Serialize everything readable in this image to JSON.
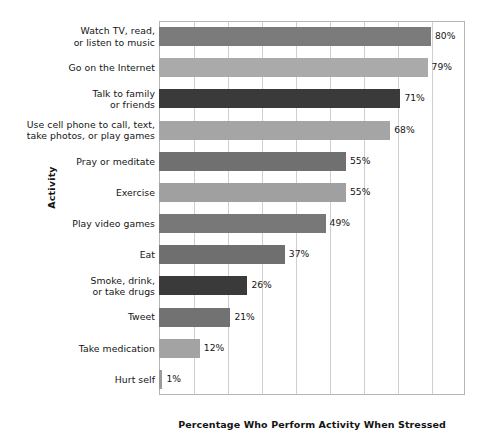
{
  "chart_data": {
    "type": "bar",
    "orientation": "horizontal",
    "title": "",
    "xlabel": "Percentage Who Perform Activity When Stressed",
    "ylabel": "Activity",
    "xlim": [
      0,
      90
    ],
    "xtick_interval": 10,
    "grid": true,
    "legend": null,
    "value_suffix": "%",
    "categories": [
      "Watch TV, read, or listen to music",
      "Go on the Internet",
      "Talk to family or friends",
      "Use cell phone to call, text, take photos, or play games",
      "Pray or meditate",
      "Exercise",
      "Play video games",
      "Eat",
      "Smoke, drink, or take drugs",
      "Tweet",
      "Take medication",
      "Hurt self"
    ],
    "values": [
      80,
      79,
      71,
      68,
      55,
      55,
      49,
      37,
      26,
      21,
      12,
      1
    ],
    "bars": [
      {
        "label_line1": "Watch TV, read,",
        "label_line2": "or listen to music",
        "value": 80,
        "value_label": "80%",
        "color": "#7b7b7b"
      },
      {
        "label_line1": "Go on the Internet",
        "label_line2": "",
        "value": 79,
        "value_label": "79%",
        "color": "#aaaaaa"
      },
      {
        "label_line1": "Talk to family",
        "label_line2": "or friends",
        "value": 71,
        "value_label": "71%",
        "color": "#3a3a3a"
      },
      {
        "label_line1": "Use cell phone to call, text,",
        "label_line2": "take photos, or play games",
        "value": 68,
        "value_label": "68%",
        "color": "#a5a5a5"
      },
      {
        "label_line1": "Pray or meditate",
        "label_line2": "",
        "value": 55,
        "value_label": "55%",
        "color": "#707070"
      },
      {
        "label_line1": "Exercise",
        "label_line2": "",
        "value": 55,
        "value_label": "55%",
        "color": "#a0a0a0"
      },
      {
        "label_line1": "Play video games",
        "label_line2": "",
        "value": 49,
        "value_label": "49%",
        "color": "#787878"
      },
      {
        "label_line1": "Eat",
        "label_line2": "",
        "value": 37,
        "value_label": "37%",
        "color": "#6f6f6f"
      },
      {
        "label_line1": "Smoke, drink,",
        "label_line2": "or take drugs",
        "value": 26,
        "value_label": "26%",
        "color": "#3a3a3a"
      },
      {
        "label_line1": "Tweet",
        "label_line2": "",
        "value": 21,
        "value_label": "21%",
        "color": "#727272"
      },
      {
        "label_line1": "Take medication",
        "label_line2": "",
        "value": 12,
        "value_label": "12%",
        "color": "#a3a3a3"
      },
      {
        "label_line1": "Hurt self",
        "label_line2": "",
        "value": 1,
        "value_label": "1%",
        "color": "#9b9b9b"
      }
    ],
    "gridlines": [
      10,
      20,
      30,
      40,
      50,
      60,
      70,
      80,
      90
    ]
  },
  "colors": {
    "frame": "#b5b5b5",
    "grid": "#cfcfcf",
    "text": "#141414",
    "background": "#ffffff"
  }
}
